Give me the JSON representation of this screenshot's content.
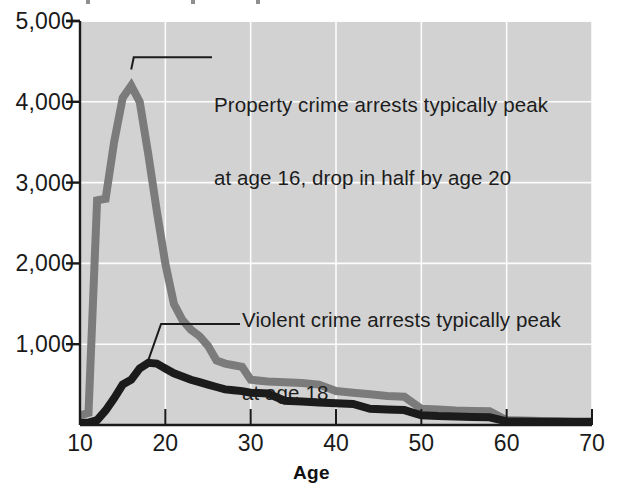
{
  "chart_data": {
    "type": "line",
    "title": "",
    "xlabel": "Age",
    "ylabel": "",
    "xlim": [
      10,
      70
    ],
    "ylim": [
      0,
      5000
    ],
    "grid": true,
    "legend_position": "none",
    "xticks": [
      10,
      20,
      30,
      40,
      50,
      60,
      70
    ],
    "xtick_labels": [
      "10",
      "20",
      "30",
      "40",
      "50",
      "60",
      "70"
    ],
    "yticks": [
      1000,
      2000,
      3000,
      4000,
      5000
    ],
    "ytick_labels": [
      "1,000",
      "2,000",
      "3,000",
      "4,000",
      "5,000"
    ],
    "series": [
      {
        "name": "Property crime arrests",
        "color": "#7b7b7b",
        "x": [
          10,
          11,
          12,
          13,
          14,
          15,
          16,
          17,
          18,
          19,
          20,
          21,
          22,
          23,
          24,
          25,
          26,
          27,
          28,
          29,
          30,
          32,
          34,
          36,
          38,
          40,
          42,
          44,
          46,
          48,
          50,
          52,
          54,
          56,
          58,
          60,
          62,
          64,
          66,
          68,
          70
        ],
        "values": [
          120,
          150,
          2780,
          2800,
          3500,
          4050,
          4200,
          4000,
          3350,
          2650,
          2000,
          1500,
          1300,
          1180,
          1100,
          980,
          800,
          760,
          740,
          720,
          560,
          540,
          530,
          520,
          500,
          420,
          400,
          380,
          360,
          350,
          200,
          190,
          180,
          175,
          170,
          60,
          55,
          50,
          48,
          45,
          45
        ]
      },
      {
        "name": "Violent crime arrests",
        "color": "#1b1b1b",
        "x": [
          10,
          11,
          12,
          13,
          14,
          15,
          16,
          17,
          18,
          19,
          20,
          21,
          22,
          23,
          24,
          25,
          26,
          27,
          28,
          29,
          30,
          32,
          34,
          36,
          38,
          40,
          42,
          44,
          46,
          48,
          50,
          52,
          54,
          56,
          58,
          60,
          62,
          64,
          66,
          68,
          70
        ],
        "values": [
          25,
          30,
          60,
          180,
          330,
          500,
          560,
          700,
          770,
          760,
          700,
          640,
          600,
          560,
          530,
          500,
          470,
          440,
          430,
          420,
          400,
          390,
          300,
          290,
          280,
          270,
          260,
          200,
          190,
          185,
          120,
          110,
          105,
          100,
          95,
          45,
          42,
          40,
          38,
          36,
          36
        ]
      }
    ],
    "annotations": [
      {
        "name": "property-crime-note",
        "line1": "Property crime arrests typically peak",
        "line2": "at age 16, drop in half by age 20",
        "leader_from": [
          16,
          4400
        ],
        "leader_to": [
          16.3,
          4550
        ]
      },
      {
        "name": "violent-crime-note",
        "line1": "Violent crime arrests typically peak",
        "line2": "at age 18",
        "leader_from": [
          18,
          800
        ],
        "leader_to": [
          19.5,
          1250
        ]
      }
    ]
  },
  "axes": {
    "x_title": "Age"
  },
  "style": {
    "plot_background": "#d2d2d2",
    "gridline_color": "#ffffff",
    "axis_color": "#1a1a1a",
    "property_line_color": "#7b7b7b",
    "violent_line_color": "#1b1b1b",
    "page_background": "#ffffff",
    "text_color": "#1a1a1a"
  }
}
